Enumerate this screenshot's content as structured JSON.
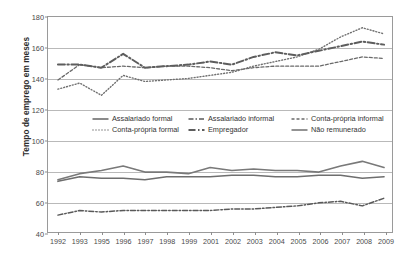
{
  "chart_data": {
    "type": "line",
    "title": "",
    "xlabel": "",
    "ylabel": "Tempo de emprego em meses",
    "ylim": [
      40,
      180
    ],
    "yticks": [
      40,
      60,
      80,
      100,
      120,
      140,
      160,
      180
    ],
    "grid": true,
    "legend_position": "center",
    "categories": [
      "1992",
      "1993",
      "1995",
      "1996",
      "1997",
      "1998",
      "1999",
      "2001",
      "2002",
      "2003",
      "2004",
      "2005",
      "2006",
      "2007",
      "2008",
      "2009"
    ],
    "series": [
      {
        "name": "Assalariado formal",
        "style": "solid",
        "color": "#6e6e6e",
        "width": 1.6,
        "values": [
          73,
          76,
          75,
          75,
          74,
          76,
          76,
          76,
          77,
          77,
          76,
          76,
          77,
          77,
          75,
          76
        ]
      },
      {
        "name": "Assalariado informal",
        "style": "dash-dot",
        "color": "#595959",
        "width": 1.5,
        "values": [
          51,
          54,
          53,
          54,
          54,
          54,
          54,
          54,
          55,
          55,
          56,
          57,
          59,
          60,
          57,
          62
        ]
      },
      {
        "name": "Conta-própria informal",
        "style": "dashed",
        "color": "#6a6a6a",
        "width": 1.3,
        "values": [
          139,
          149,
          147,
          148,
          147,
          148,
          148,
          147,
          145,
          147,
          148,
          148,
          148,
          151,
          154,
          153
        ]
      },
      {
        "name": "Conta-própria formal",
        "style": "dotted",
        "color": "#707070",
        "width": 1.4,
        "values": [
          133,
          137,
          129,
          142,
          138,
          139,
          140,
          142,
          144,
          148,
          151,
          154,
          159,
          167,
          173,
          169
        ]
      },
      {
        "name": "Empregador",
        "style": "long-dash-dot",
        "color": "#5d5d5d",
        "width": 2.0,
        "values": [
          149,
          149,
          147,
          156,
          147,
          148,
          149,
          151,
          149,
          154,
          157,
          155,
          158,
          161,
          164,
          162
        ]
      },
      {
        "name": "Não remunerado",
        "style": "solid",
        "color": "#797979",
        "width": 1.6,
        "values": [
          74,
          78,
          80,
          83,
          79,
          79,
          78,
          82,
          80,
          81,
          80,
          80,
          79,
          83,
          86,
          82
        ]
      }
    ]
  },
  "legend": {
    "items": [
      {
        "label": "Assalariado formal",
        "style": "solid"
      },
      {
        "label": "Assalariado informal",
        "style": "dash-dot"
      },
      {
        "label": "Conta-própria informal",
        "style": "dashed"
      },
      {
        "label": "Conta-própria formal",
        "style": "dotted"
      },
      {
        "label": "Empregador",
        "style": "long-dash-dot"
      },
      {
        "label": "Não remunerado",
        "style": "solid"
      }
    ]
  }
}
